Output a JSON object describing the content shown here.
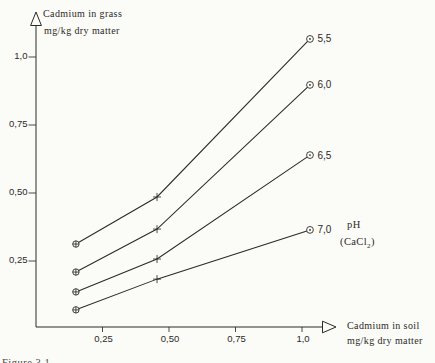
{
  "labels": {
    "y_title_1": "Cadmium in grass",
    "y_title_2": "mg/kg dry matter",
    "x_title_1": "Cadmium in soil",
    "x_title_2": "mg/kg dry matter",
    "legend_ph": "pH",
    "legend_cacl_prefix": "(CaCl",
    "legend_cacl_sub": "2",
    "legend_cacl_suffix": ")",
    "caption_fragment": "Figure 3.1"
  },
  "chart_data": {
    "type": "line",
    "title": "",
    "xlabel": "Cadmium in soil mg/kg dry matter",
    "ylabel": "Cadmium in grass mg/kg dry matter",
    "legend": {
      "title": "pH",
      "note": "(CaCl2)",
      "position": "right-middle"
    },
    "grid": false,
    "xlim": [
      0,
      1.12
    ],
    "ylim": [
      0,
      1.12
    ],
    "x": [
      0.15,
      0.455,
      1.03
    ],
    "series": [
      {
        "name": "5,5",
        "ph": 5.5,
        "values": [
          0.305,
          0.478,
          1.059
        ]
      },
      {
        "name": "6,0",
        "ph": 6.0,
        "values": [
          0.202,
          0.36,
          0.89
        ]
      },
      {
        "name": "6,5",
        "ph": 6.5,
        "values": [
          0.129,
          0.25,
          0.632
        ]
      },
      {
        "name": "7,0",
        "ph": 7.0,
        "values": [
          0.063,
          0.176,
          0.357
        ]
      }
    ],
    "x_ticks": [
      {
        "value": 0.25,
        "label": "0,25"
      },
      {
        "value": 0.5,
        "label": "0,50"
      },
      {
        "value": 0.75,
        "label": "0,75"
      },
      {
        "value": 1.0,
        "label": "1,0"
      }
    ],
    "y_ticks": [
      {
        "value": 0.25,
        "label": "0,25"
      },
      {
        "value": 0.5,
        "label": "0,50"
      },
      {
        "value": 0.75,
        "label": "0,75"
      },
      {
        "value": 1.0,
        "label": "1,0"
      }
    ],
    "markers": {
      "left": "circle-plus",
      "middle": "plus",
      "right": "circle-dot"
    },
    "colors": {
      "ink": "#2b2a26",
      "paper": "#fbfbf8"
    }
  }
}
